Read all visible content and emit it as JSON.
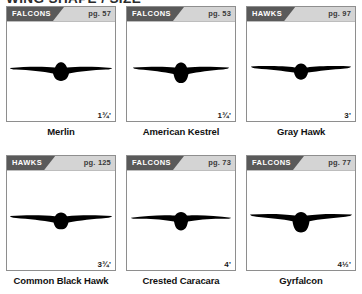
{
  "heading": "WING SHAPE / SIZE",
  "panels": [
    {
      "category": "FALCONS",
      "page": "pg. 57",
      "wingspan": "1¾'",
      "species": "Merlin",
      "silhouette": "merlin-silhouette"
    },
    {
      "category": "FALCONS",
      "page": "pg. 53",
      "wingspan": "1¾'",
      "species": "American Kestrel",
      "silhouette": "american-kestrel-silhouette"
    },
    {
      "category": "HAWKS",
      "page": "pg. 97",
      "wingspan": "3'",
      "species": "Gray Hawk",
      "silhouette": "gray-hawk-silhouette"
    },
    {
      "category": "HAWKS",
      "page": "pg. 125",
      "wingspan": "3¾'",
      "species": "Common Black Hawk",
      "silhouette": "common-black-hawk-silhouette"
    },
    {
      "category": "FALCONS",
      "page": "pg. 73",
      "wingspan": "4'",
      "species": "Crested Caracara",
      "silhouette": "crested-caracara-silhouette"
    },
    {
      "category": "FALCONS",
      "page": "pg. 77",
      "wingspan": "4½'",
      "species": "Gyrfalcon",
      "silhouette": "gyrfalcon-silhouette"
    }
  ],
  "colors": {
    "tab_background": "#5a5a5a",
    "header_background": "#d4d4d4",
    "panel_border": "#8e8e8e",
    "silhouette": "#000000",
    "text": "#111111"
  }
}
